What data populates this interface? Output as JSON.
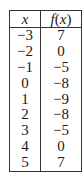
{
  "table": {
    "headers": {
      "x": "x",
      "fx_func": "f",
      "fx_open": "(",
      "fx_var": "x",
      "fx_close": ")"
    },
    "rows": [
      {
        "x": "−3",
        "fx": "7"
      },
      {
        "x": "−2",
        "fx": "0"
      },
      {
        "x": "−1",
        "fx": "−5"
      },
      {
        "x": "0",
        "fx": "−8"
      },
      {
        "x": "1",
        "fx": "−9"
      },
      {
        "x": "2",
        "fx": "−8"
      },
      {
        "x": "3",
        "fx": "−5"
      },
      {
        "x": "4",
        "fx": "0"
      },
      {
        "x": "5",
        "fx": "7"
      }
    ]
  }
}
